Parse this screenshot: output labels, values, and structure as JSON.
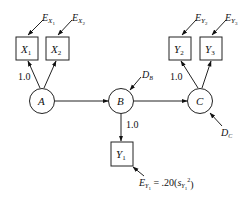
{
  "diagram": {
    "type": "path-model",
    "latent": [
      {
        "id": "A",
        "label": "A"
      },
      {
        "id": "B",
        "label": "B"
      },
      {
        "id": "C",
        "label": "C"
      }
    ],
    "observed": [
      {
        "id": "X1",
        "label": "X",
        "sub": "1"
      },
      {
        "id": "X2",
        "label": "X",
        "sub": "2"
      },
      {
        "id": "Y1",
        "label": "Y",
        "sub": "1"
      },
      {
        "id": "Y2",
        "label": "Y",
        "sub": "2"
      },
      {
        "id": "Y3",
        "label": "Y",
        "sub": "3"
      }
    ],
    "errors": {
      "ex1": {
        "label": "E",
        "sub": "X",
        "subsub": "1"
      },
      "ex2": {
        "label": "E",
        "sub": "X",
        "subsub": "2"
      },
      "ey2": {
        "label": "E",
        "sub": "Y",
        "subsub": "2"
      },
      "ey3": {
        "label": "E",
        "sub": "Y",
        "subsub": "3"
      },
      "ey1": {
        "label": "E",
        "sub": "Y",
        "subsub": "1",
        "eq": " = .20(",
        "s": "s",
        "s_sub": "Y",
        "s_subsub": "1",
        "s_sup": "2",
        "close": ")"
      }
    },
    "disturbances": {
      "db": {
        "label": "D",
        "sub": "B"
      },
      "dc": {
        "label": "D",
        "sub": "C"
      }
    },
    "loadings": {
      "a_x1": "1.0",
      "c_y2": "1.0",
      "b_y1": "1.0"
    }
  }
}
